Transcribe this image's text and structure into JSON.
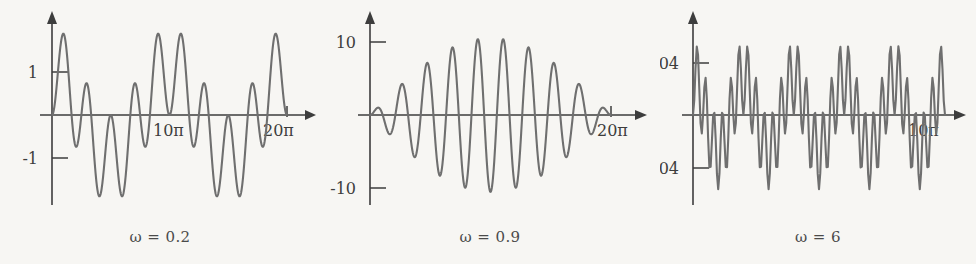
{
  "figure": {
    "background_color": "#f7f6f3",
    "curve_color": "#6f6f6f",
    "axis_color": "#3d3d3d"
  },
  "chart_data": [
    {
      "type": "line",
      "title": "",
      "caption": "ω = 0.2",
      "omega": 0.2,
      "function": "(cos(omega*t) - cos(t)) / (1 - omega^2)",
      "xlabel": "",
      "ylabel": "",
      "xlim": [
        0,
        62.83
      ],
      "ylim": [
        -1.6,
        1.6
      ],
      "x_tick_labels": [
        "10π",
        "20π"
      ],
      "x_tick_values": [
        31.416,
        62.832
      ],
      "y_tick_labels": [
        "1",
        "-1"
      ],
      "y_tick_values": [
        1,
        -1
      ],
      "grid": false,
      "legend": "none",
      "axis_style": "arrow-headed cartesian axes through origin"
    },
    {
      "type": "line",
      "title": "",
      "caption": "ω = 0.9",
      "omega": 0.9,
      "function": "(cos(omega*t) - cos(t)) / (1 - omega^2)",
      "xlabel": "",
      "ylabel": "",
      "xlim": [
        0,
        62.83
      ],
      "ylim": [
        -12,
        12
      ],
      "x_tick_labels": [
        "20π"
      ],
      "x_tick_values": [
        62.832
      ],
      "y_tick_labels": [
        "10",
        "-10"
      ],
      "y_tick_values": [
        10,
        -10
      ],
      "grid": false,
      "legend": "none",
      "axis_style": "arrow-headed cartesian axes through origin"
    },
    {
      "type": "line",
      "title": "",
      "caption": "ω = 6",
      "omega": 6,
      "function": "(cos(omega*t) - cos(t)) / (1 - omega^2)",
      "xlabel": "",
      "ylabel": "",
      "xlim": [
        0,
        31.42
      ],
      "ylim": [
        -0.062,
        0.062
      ],
      "x_tick_labels": [
        "10π"
      ],
      "x_tick_values": [
        31.416
      ],
      "y_tick_labels": [
        "0.04",
        "-0.04"
      ],
      "y_tick_values": [
        0.04,
        -0.04
      ],
      "grid": false,
      "legend": "none",
      "axis_style": "arrow-headed cartesian axes through origin"
    }
  ],
  "panels": [
    {
      "id": "panel-omega-0-2",
      "caption": "ω = 0.2",
      "y_top_label": "1",
      "y_bottom_label": "-1",
      "x_mid_label": "10π",
      "x_end_label": "20π"
    },
    {
      "id": "panel-omega-0-9",
      "caption": "ω = 0.9",
      "y_top_label": "10",
      "y_bottom_label": "-10",
      "x_mid_label": "",
      "x_end_label": "20π"
    },
    {
      "id": "panel-omega-6",
      "caption": "ω = 6",
      "y_top_label": "0.04",
      "y_bottom_label": "-0.04",
      "x_mid_label": "",
      "x_end_label": "10π"
    }
  ]
}
